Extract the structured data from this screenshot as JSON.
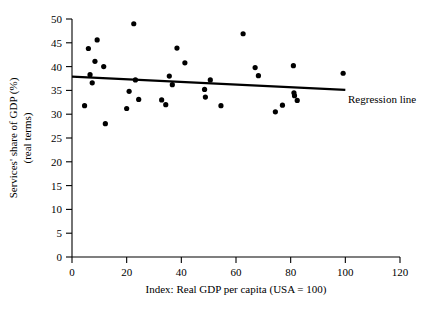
{
  "chart_data": {
    "type": "scatter",
    "title": "",
    "xlabel": "Index: Real GDP per capita (USA = 100)",
    "ylabel": "Services' share of GDP (%)",
    "ylabel_line2": "(real terms)",
    "xlim": [
      0,
      120
    ],
    "ylim": [
      0,
      50
    ],
    "xticks": [
      0,
      20,
      40,
      60,
      80,
      100,
      120
    ],
    "yticks": [
      0,
      5,
      10,
      15,
      20,
      25,
      30,
      35,
      40,
      45,
      50
    ],
    "grid": false,
    "legend": "none",
    "series": [
      {
        "name": "Countries",
        "marker": "filled-circle",
        "color": "#000000",
        "points": [
          {
            "x": 4.6,
            "y": 31.8
          },
          {
            "x": 6.0,
            "y": 43.8
          },
          {
            "x": 6.6,
            "y": 38.3
          },
          {
            "x": 7.4,
            "y": 36.6
          },
          {
            "x": 8.4,
            "y": 41.1
          },
          {
            "x": 9.2,
            "y": 45.6
          },
          {
            "x": 11.6,
            "y": 40.0
          },
          {
            "x": 12.2,
            "y": 28.0
          },
          {
            "x": 20.0,
            "y": 31.2
          },
          {
            "x": 20.9,
            "y": 34.8
          },
          {
            "x": 22.6,
            "y": 49.0
          },
          {
            "x": 23.2,
            "y": 37.2
          },
          {
            "x": 24.4,
            "y": 33.1
          },
          {
            "x": 32.8,
            "y": 33.0
          },
          {
            "x": 34.3,
            "y": 32.0
          },
          {
            "x": 35.6,
            "y": 38.0
          },
          {
            "x": 36.7,
            "y": 36.2
          },
          {
            "x": 38.4,
            "y": 43.9
          },
          {
            "x": 41.3,
            "y": 40.8
          },
          {
            "x": 48.5,
            "y": 35.2
          },
          {
            "x": 48.8,
            "y": 33.6
          },
          {
            "x": 50.6,
            "y": 37.2
          },
          {
            "x": 54.5,
            "y": 31.8
          },
          {
            "x": 62.6,
            "y": 46.9
          },
          {
            "x": 67.0,
            "y": 39.8
          },
          {
            "x": 68.2,
            "y": 38.1
          },
          {
            "x": 74.4,
            "y": 30.5
          },
          {
            "x": 77.0,
            "y": 31.9
          },
          {
            "x": 81.0,
            "y": 40.2
          },
          {
            "x": 81.2,
            "y": 34.5
          },
          {
            "x": 81.4,
            "y": 33.9
          },
          {
            "x": 82.4,
            "y": 32.9
          },
          {
            "x": 99.2,
            "y": 38.6
          }
        ]
      }
    ],
    "annotations": [
      {
        "name": "regression-line",
        "label": "Regression line",
        "type": "line",
        "x_start": 0,
        "y_start": 37.9,
        "x_end": 100,
        "y_end": 35.1
      }
    ]
  }
}
